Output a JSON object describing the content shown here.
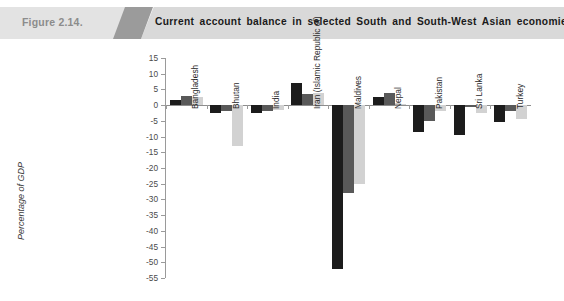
{
  "header": {
    "figure_number": "Figure 2.14.",
    "title": "Current account balance in selected South and South-West Asian economies, 2008-2010"
  },
  "legend": {
    "position": "bottom",
    "items": [
      {
        "label": "2008",
        "color": "#1c1c1c"
      },
      {
        "label": "2009",
        "color": "#595959"
      },
      {
        "label": "2010",
        "color": "#d2d2d2"
      }
    ]
  },
  "axis": {
    "ylabel": "Percentage of GDP",
    "yticks": [
      "15",
      "10",
      "5",
      "0",
      "-5",
      "-10",
      "-15",
      "-20",
      "-25",
      "-30",
      "-35",
      "-40",
      "-45",
      "-50",
      "-55"
    ]
  },
  "chart_data": {
    "type": "bar",
    "title": "Current account balance in selected South and South-West Asian economies, 2008-2010",
    "xlabel": "",
    "ylabel": "Percentage of GDP",
    "ylim": [
      -55,
      15
    ],
    "ytick_step": 5,
    "grid": false,
    "legend_position": "bottom",
    "categories": [
      "Bangladesh",
      "Bhutan",
      "India",
      "Iran (Islamic Republic of)",
      "Maldives",
      "Nepal",
      "Pakistan",
      "Sri Lanka",
      "Turkey"
    ],
    "series": [
      {
        "name": "2008",
        "color": "#1c1c1c",
        "values": [
          1.5,
          -2.5,
          -2.5,
          7.0,
          -52.0,
          2.5,
          -8.5,
          -9.5,
          -5.5
        ]
      },
      {
        "name": "2009",
        "color": "#595959",
        "values": [
          3.0,
          -2.0,
          -2.0,
          3.5,
          -28.0,
          4.0,
          -5.0,
          -0.5,
          -2.0
        ]
      },
      {
        "name": "2010",
        "color": "#d2d2d2",
        "values": [
          2.5,
          -13.0,
          -1.5,
          4.0,
          -25.0,
          0.5,
          -2.0,
          -2.5,
          -4.5
        ]
      }
    ]
  }
}
